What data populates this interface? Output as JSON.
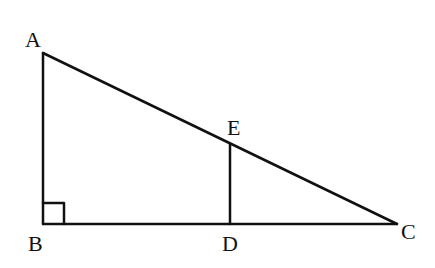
{
  "diagram": {
    "type": "geometry",
    "stroke_color": "#111111",
    "points": {
      "A": {
        "label": "A",
        "x": 43,
        "y": 53
      },
      "B": {
        "label": "B",
        "x": 43,
        "y": 224
      },
      "C": {
        "label": "C",
        "x": 397,
        "y": 224
      },
      "D": {
        "label": "D",
        "x": 230,
        "y": 224
      },
      "E": {
        "label": "E",
        "x": 230,
        "y": 144
      }
    },
    "segments": [
      {
        "from": "A",
        "to": "B"
      },
      {
        "from": "B",
        "to": "C"
      },
      {
        "from": "A",
        "to": "C"
      },
      {
        "from": "D",
        "to": "E"
      }
    ],
    "right_angle_markers": [
      {
        "vertex": "B",
        "size": 21
      }
    ]
  }
}
